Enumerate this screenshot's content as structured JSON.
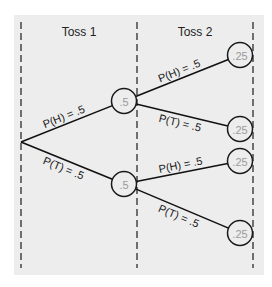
{
  "diagram": {
    "type": "probability-tree",
    "columns": [
      {
        "label": "Toss 1",
        "x": 79,
        "y": 36
      },
      {
        "label": "Toss 2",
        "x": 195,
        "y": 36
      }
    ],
    "guides_x": [
      21,
      137,
      253
    ],
    "root": {
      "x": 21,
      "y": 142
    },
    "level1": [
      {
        "id": "h",
        "x": 124,
        "y": 101,
        "value": ".5",
        "edge_label": "P(H) = .5"
      },
      {
        "id": "t",
        "x": 124,
        "y": 184,
        "value": ".5",
        "edge_label": "P(T) = .5"
      }
    ],
    "level2": [
      {
        "parent": "h",
        "x": 240,
        "y": 55,
        "value": ".25",
        "edge_label": "P(H) = .5"
      },
      {
        "parent": "h",
        "x": 240,
        "y": 129,
        "value": ".25",
        "edge_label": "P(T) = .5"
      },
      {
        "parent": "t",
        "x": 240,
        "y": 161,
        "value": ".25",
        "edge_label": "P(H) = .5"
      },
      {
        "parent": "t",
        "x": 240,
        "y": 233,
        "value": ".25",
        "edge_label": "P(T) = .5"
      }
    ],
    "node_radius": 12.5,
    "colors": {
      "panel": "#ededed",
      "line": "#111111",
      "node_text": "#9a9a9a"
    }
  }
}
